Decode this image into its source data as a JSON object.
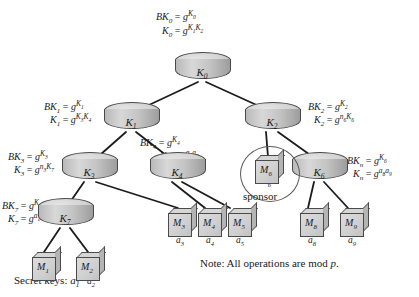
{
  "figure": {
    "note": "Note: All operations are mod p.",
    "note_plain": "Note: All operations are mod ",
    "note_var": "p",
    "note_end": ".",
    "secret_keys_label": "Secret keys:",
    "sponsor_label": "sponsor"
  },
  "key_nodes": [
    {
      "id": "k0",
      "label": "K",
      "sub": "0"
    },
    {
      "id": "k1",
      "label": "K",
      "sub": "1"
    },
    {
      "id": "k2",
      "label": "K",
      "sub": "2"
    },
    {
      "id": "k3",
      "label": "K",
      "sub": "3"
    },
    {
      "id": "k4",
      "label": "K",
      "sub": "4"
    },
    {
      "id": "k6",
      "label": "K",
      "sub": "6"
    },
    {
      "id": "k7",
      "label": "K",
      "sub": "7"
    }
  ],
  "member_nodes": [
    {
      "id": "m1",
      "label": "M",
      "sub": "1",
      "key": "a",
      "keysub": "1"
    },
    {
      "id": "m2",
      "label": "M",
      "sub": "2",
      "key": "a",
      "keysub": "2"
    },
    {
      "id": "m3",
      "label": "M",
      "sub": "3",
      "key": "a",
      "keysub": "3"
    },
    {
      "id": "m4",
      "label": "M",
      "sub": "4",
      "key": "a",
      "keysub": "4"
    },
    {
      "id": "m5",
      "label": "M",
      "sub": "5",
      "key": "a",
      "keysub": "5"
    },
    {
      "id": "m6",
      "label": "M",
      "sub": "6",
      "key": "n",
      "keysub": "6"
    },
    {
      "id": "m8",
      "label": "M",
      "sub": "8",
      "key": "a",
      "keysub": "8"
    },
    {
      "id": "m9",
      "label": "M",
      "sub": "9",
      "key": "a",
      "keysub": "9"
    }
  ],
  "formulas": {
    "k0": {
      "blinded": {
        "lhs": "BK",
        "lhs_sub": "0",
        "eq": "=",
        "base": "g",
        "exp": "K",
        "exp_sub": "0"
      },
      "secret": {
        "lhs": "K",
        "lhs_sub": "0",
        "eq": "=",
        "base": "g",
        "exp": "K",
        "exp_sub": "1",
        "exp2": "K",
        "exp2_sub": "2"
      }
    },
    "k1": {
      "blinded": {
        "lhs": "BK",
        "lhs_sub": "1",
        "eq": "=",
        "base": "g",
        "exp": "K",
        "exp_sub": "1"
      },
      "secret": {
        "lhs": "K",
        "lhs_sub": "1",
        "eq": "=",
        "base": "g",
        "exp": "K",
        "exp_sub": "3",
        "exp2": "K",
        "exp2_sub": "4"
      }
    },
    "k2": {
      "blinded": {
        "lhs": "BK",
        "lhs_sub": "2",
        "eq": "=",
        "base": "g",
        "exp": "K",
        "exp_sub": "2"
      },
      "secret": {
        "lhs": "K",
        "lhs_sub": "2",
        "eq": "=",
        "base": "g",
        "exp": "n",
        "exp_sub": "6",
        "exp2": "K",
        "exp2_sub": "6"
      }
    },
    "k3": {
      "blinded": {
        "lhs": "BK",
        "lhs_sub": "3",
        "eq": "=",
        "base": "g",
        "exp": "K",
        "exp_sub": "3"
      },
      "secret": {
        "lhs": "K",
        "lhs_sub": "3",
        "eq": "=",
        "base": "g",
        "exp": "n",
        "exp_sub": "3",
        "exp2": "K",
        "exp2_sub": "7"
      }
    },
    "k4": {
      "blinded": {
        "lhs": "BK",
        "lhs_sub": "4",
        "eq": "=",
        "base": "g",
        "exp": "K",
        "exp_sub": "4"
      },
      "secret": {
        "lhs": "K",
        "lhs_sub": "4",
        "eq": "=",
        "base": "g",
        "exp": "a",
        "exp_sub": "4",
        "exp2": "a",
        "exp2_sub": "5"
      }
    },
    "k6": {
      "blinded": {
        "lhs": "BK",
        "lhs_sub": "n",
        "eq": "=",
        "base": "g",
        "exp": "K",
        "exp_sub": "6"
      },
      "secret": {
        "lhs": "K",
        "lhs_sub": "n",
        "eq": "=",
        "base": "g",
        "exp": "a",
        "exp_sub": "8",
        "exp2": "a",
        "exp2_sub": "9"
      }
    },
    "k7": {
      "blinded": {
        "lhs": "BK",
        "lhs_sub": "7",
        "eq": "=",
        "base": "g",
        "exp": "K",
        "exp_sub": "7"
      },
      "secret": {
        "lhs": "K",
        "lhs_sub": "7",
        "eq": "=",
        "base": "g",
        "exp": "a",
        "exp_sub": "1",
        "exp2": "a",
        "exp2_sub": "2"
      }
    }
  },
  "sponsor": {
    "node_key": "n",
    "node_key_sub": "6",
    "caption": "sponsor"
  },
  "colors": {
    "node_fill": "#cfcfcf",
    "node_stroke": "#4a4a4a",
    "edge": "#1c1c1c",
    "text": "#1a1a1a",
    "background": "#ffffff"
  }
}
